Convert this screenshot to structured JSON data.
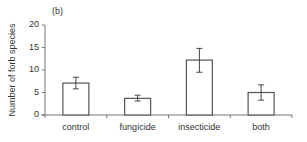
{
  "chart_data": {
    "type": "bar",
    "panel_label": "(b)",
    "title": "",
    "xlabel": "",
    "ylabel": "Number of forb species",
    "categories": [
      "control",
      "fungicide",
      "insecticide",
      "both"
    ],
    "values": [
      7.1,
      3.7,
      12.2,
      5.0
    ],
    "error_bars": {
      "upper": [
        8.4,
        4.4,
        14.8,
        6.7
      ],
      "lower": [
        5.8,
        3.1,
        9.5,
        3.3
      ]
    },
    "ylim": [
      0,
      20
    ],
    "yticks": [
      0,
      5,
      10,
      15,
      20
    ],
    "grid": false,
    "legend": null,
    "bar_fill": "#ffffff",
    "bar_edge": "#555555"
  }
}
